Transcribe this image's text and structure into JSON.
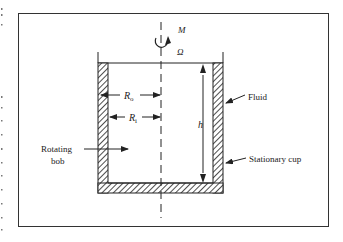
{
  "figure": {
    "labels": {
      "moment": "M",
      "angular_velocity": "Ω",
      "outer_radius": "R",
      "outer_radius_sub": "o",
      "inner_radius": "R",
      "inner_radius_sub": "i",
      "height": "h",
      "fluid": "Fluid",
      "rotating_bob_line1": "Rotating",
      "rotating_bob_line2": "bob",
      "stationary_cup": "Stationary cup"
    },
    "colors": {
      "line": "#222222",
      "frame": "#333333",
      "background": "#ffffff"
    }
  }
}
